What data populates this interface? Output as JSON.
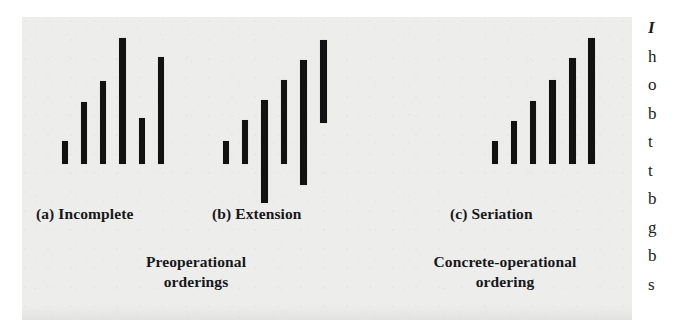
{
  "figure": {
    "background_color": "#ededeb",
    "page_color": "#ffffff",
    "bar_color": "#121212",
    "panel": {
      "x": 22,
      "y": 17,
      "width": 610,
      "height": 303
    },
    "baseline_y": 164
  },
  "groups": [
    {
      "id": "a",
      "label": "(a) Incomplete",
      "label_x": 36,
      "label_y": 205,
      "description": "incomplete preoperational ordering: six bars of unequal height sharing a common baseline, heights not monotonic",
      "bars": [
        {
          "x": 62,
          "top": 141,
          "bottom": 164,
          "width": 6
        },
        {
          "x": 81,
          "top": 102,
          "bottom": 164,
          "width": 6
        },
        {
          "x": 100,
          "top": 81,
          "bottom": 164,
          "width": 6
        },
        {
          "x": 119,
          "top": 38,
          "bottom": 164,
          "width": 7
        },
        {
          "x": 139,
          "top": 118,
          "bottom": 164,
          "width": 6
        },
        {
          "x": 158,
          "top": 57,
          "bottom": 164,
          "width": 6
        }
      ]
    },
    {
      "id": "b",
      "label": "(b) Extension",
      "label_x": 212,
      "label_y": 205,
      "description": "extension-only preoperational ordering: tops ascend but bottoms are not aligned on a common baseline",
      "bars": [
        {
          "x": 223,
          "top": 141,
          "bottom": 164,
          "width": 6
        },
        {
          "x": 242,
          "top": 120,
          "bottom": 164,
          "width": 6
        },
        {
          "x": 261,
          "top": 100,
          "bottom": 203,
          "width": 7
        },
        {
          "x": 281,
          "top": 80,
          "bottom": 164,
          "width": 6
        },
        {
          "x": 300,
          "top": 60,
          "bottom": 185,
          "width": 7
        },
        {
          "x": 320,
          "top": 40,
          "bottom": 123,
          "width": 7
        }
      ]
    },
    {
      "id": "c",
      "label": "(c) Seriation",
      "label_x": 450,
      "label_y": 205,
      "description": "concrete-operational seriation: six bars ascending in even steps from a common baseline",
      "bars": [
        {
          "x": 492,
          "top": 141,
          "bottom": 164,
          "width": 6
        },
        {
          "x": 511,
          "top": 121,
          "bottom": 164,
          "width": 6
        },
        {
          "x": 530,
          "top": 101,
          "bottom": 164,
          "width": 6
        },
        {
          "x": 549,
          "top": 80,
          "bottom": 164,
          "width": 7
        },
        {
          "x": 569,
          "top": 58,
          "bottom": 164,
          "width": 7
        },
        {
          "x": 588,
          "top": 38,
          "bottom": 164,
          "width": 7
        }
      ]
    }
  ],
  "captions": [
    {
      "id": "preoperational",
      "line1": "Preoperational",
      "line2": "orderings",
      "center_x": 196,
      "y": 252
    },
    {
      "id": "concrete-operational",
      "line1": "Concrete-operational",
      "line2": "ordering",
      "center_x": 505,
      "y": 252
    }
  ],
  "text_column": {
    "note": "partially cropped left edge of the adjacent body-text column",
    "lines": [
      "I",
      "h",
      "o",
      "b",
      "t",
      "t",
      "b",
      "g",
      "b",
      "s"
    ]
  }
}
